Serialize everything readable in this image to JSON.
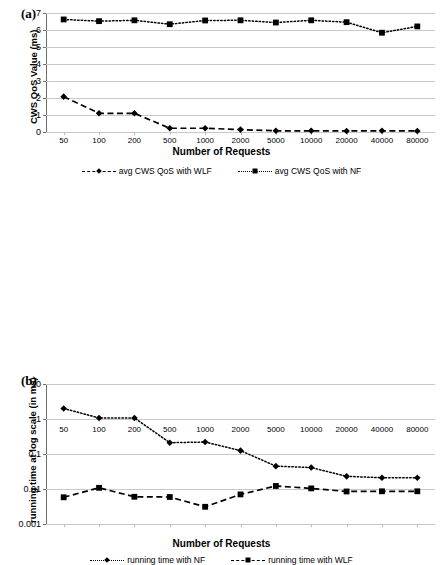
{
  "figure": {
    "panel_a_label": "(a)",
    "panel_b_label": "(b)"
  },
  "chart_data": [
    {
      "id": "chart-a",
      "type": "line",
      "title": "",
      "panel": "(a)",
      "xlabel": "Number of Requests",
      "ylabel": "CWS QoS Value (ms)",
      "categories": [
        "50",
        "100",
        "200",
        "500",
        "1000",
        "2000",
        "5000",
        "10000",
        "20000",
        "40000",
        "80000"
      ],
      "ylim": [
        0,
        7
      ],
      "yticks": [
        "0",
        "1",
        "2",
        "3",
        "4",
        "5",
        "6",
        "7"
      ],
      "yscale": "linear",
      "grid": true,
      "legend_position": "bottom",
      "series": [
        {
          "name": "avg CWS QoS with WLF",
          "marker": "diamond",
          "linestyle": "dashed",
          "values": [
            2.08,
            1.1,
            1.1,
            0.22,
            0.22,
            0.14,
            0.07,
            0.07,
            0.06,
            0.07,
            0.06
          ]
        },
        {
          "name": "avg CWS QoS with NF",
          "marker": "square",
          "linestyle": "dotted",
          "values": [
            6.62,
            6.52,
            6.57,
            6.34,
            6.56,
            6.57,
            6.44,
            6.57,
            6.46,
            5.84,
            6.21
          ]
        }
      ]
    },
    {
      "id": "chart-b",
      "type": "line",
      "panel": "(b)",
      "xlabel": "Number of Requests",
      "ylabel": "running time at log scale (in ms)",
      "categories": [
        "50",
        "100",
        "200",
        "500",
        "1000",
        "2000",
        "5000",
        "10000",
        "20000",
        "40000",
        "80000"
      ],
      "ylim": [
        0.001,
        10
      ],
      "yticks": [
        "0.001",
        "0.01",
        "0.1",
        "1",
        "10"
      ],
      "yscale": "log",
      "grid": true,
      "legend_position": "bottom",
      "series": [
        {
          "name": "running time with NF",
          "marker": "diamond",
          "linestyle": "dotted",
          "values": [
            2.0,
            1.07,
            1.07,
            0.21,
            0.22,
            0.125,
            0.045,
            0.041,
            0.023,
            0.021,
            0.021
          ]
        },
        {
          "name": "running time with WLF",
          "marker": "square",
          "linestyle": "dashed",
          "values": [
            0.0058,
            0.0108,
            0.006,
            0.0059,
            0.0031,
            0.007,
            0.0122,
            0.0104,
            0.0085,
            0.0086,
            0.0086
          ]
        }
      ]
    }
  ]
}
